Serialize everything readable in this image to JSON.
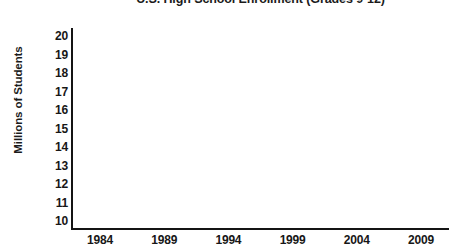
{
  "chart_data": {
    "type": "line",
    "title": "U.S. High School Enrollment (Grades 9-12)",
    "title_clipped": true,
    "xlabel": "",
    "ylabel": "Millions of Students",
    "x_tick_labels": [
      "1984",
      "1989",
      "1994",
      "1999",
      "2004",
      "2009"
    ],
    "x_tick_values": [
      1984,
      1989,
      1994,
      1999,
      2004,
      2009
    ],
    "y_tick_labels": [
      "20",
      "19",
      "18",
      "17",
      "16",
      "15",
      "14",
      "13",
      "12",
      "11",
      "10"
    ],
    "y_tick_values": [
      20,
      19,
      18,
      17,
      16,
      15,
      14,
      13,
      12,
      11,
      10
    ],
    "xlim": [
      1984,
      2011
    ],
    "ylim": [
      10,
      20
    ],
    "grid": false,
    "legend": false,
    "legend_position": "none",
    "series": [],
    "values": [],
    "annotations": [],
    "note": "Blank chart template: axes and labels only, no data plotted in the plot area.",
    "colors": {
      "axis": "#141414",
      "text": "#171717",
      "background": "#ffffff"
    }
  }
}
